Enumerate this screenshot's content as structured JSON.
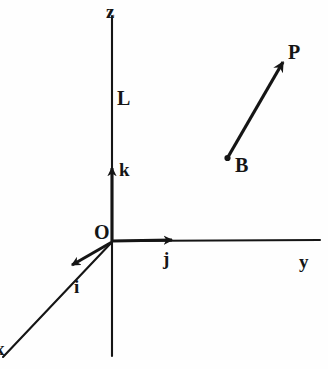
{
  "figure": {
    "background_color": "#fefefe",
    "ink_color": "#151515",
    "axes": [
      {
        "name": "x",
        "label": "x",
        "label_x": 0,
        "label_y": 339,
        "from": [
          112,
          242
        ],
        "to": [
          4,
          356
        ],
        "note": "label clipped at left edge of figure"
      },
      {
        "name": "y",
        "label": "y",
        "label_x": 299,
        "label_y": 252,
        "from": [
          112,
          242
        ],
        "to": [
          320,
          240
        ]
      },
      {
        "name": "z",
        "label": "z",
        "label_x": 106,
        "label_y": 2,
        "from": [
          112,
          356
        ],
        "to": [
          112,
          16
        ]
      }
    ],
    "unit_vectors": [
      {
        "name": "i",
        "label": "i",
        "label_x": 74,
        "label_y": 277,
        "from": [
          112,
          242
        ],
        "to": [
          65,
          270
        ]
      },
      {
        "name": "j",
        "label": "j",
        "label_x": 163,
        "label_y": 249,
        "from": [
          112,
          241
        ],
        "to": [
          178,
          240
        ]
      },
      {
        "name": "k",
        "label": "k",
        "label_x": 119,
        "label_y": 160,
        "from": [
          112,
          240
        ],
        "to": [
          112,
          166
        ]
      }
    ],
    "points": [
      {
        "name": "O",
        "label": "O",
        "label_x": 94,
        "label_y": 222,
        "x": 112,
        "y": 242,
        "has_dot": false
      },
      {
        "name": "B",
        "label": "B",
        "label_x": 235,
        "label_y": 155,
        "x": 227,
        "y": 158,
        "has_dot": true
      },
      {
        "name": "P",
        "label": "P",
        "label_x": 288,
        "label_y": 42,
        "x": 286,
        "y": 55,
        "has_dot": false
      }
    ],
    "vectors": [
      {
        "name": "BP",
        "from_point": "B",
        "to_point": "P",
        "from": [
          227,
          158
        ],
        "to": [
          286,
          56
        ]
      }
    ],
    "length_labels": [
      {
        "name": "L",
        "label": "L",
        "label_x": 117,
        "label_y": 88,
        "describes": "z"
      }
    ]
  }
}
